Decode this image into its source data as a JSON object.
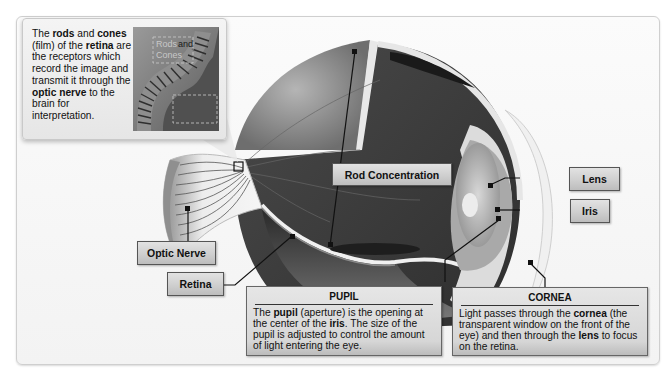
{
  "diagram": {
    "inset": {
      "text_parts": [
        {
          "t": "The ",
          "b": false
        },
        {
          "t": "rods",
          "b": true
        },
        {
          "t": " and ",
          "b": false
        },
        {
          "t": "cones",
          "b": true
        },
        {
          "t": " (film) of the ",
          "b": false
        },
        {
          "t": "retina",
          "b": true
        },
        {
          "t": " are the receptors which record the image and transmit it through the ",
          "b": false
        },
        {
          "t": "optic nerve",
          "b": true
        },
        {
          "t": " to the brain for interpretation.",
          "b": false
        }
      ],
      "image_label_line1_a": "Rods",
      "image_label_line1_b": "and",
      "image_label_line2": "Cones"
    },
    "labels": {
      "optic_nerve": "Optic Nerve",
      "retina": "Retina",
      "rod_concentration": "Rod Concentration",
      "lens": "Lens",
      "iris": "Iris"
    },
    "pupil_box": {
      "heading": "PUPIL",
      "text_parts": [
        {
          "t": "The ",
          "b": false
        },
        {
          "t": "pupil",
          "b": true
        },
        {
          "t": " (aperture) is the opening at the center of the ",
          "b": false
        },
        {
          "t": "iris",
          "b": true
        },
        {
          "t": ". The size of the pupil is adjusted to control the amount of light entering the eye.",
          "b": false
        }
      ]
    },
    "cornea_box": {
      "heading": "CORNEA",
      "text_parts": [
        {
          "t": "Light passes through the ",
          "b": false
        },
        {
          "t": "cornea",
          "b": true
        },
        {
          "t": " (the transparent window on the front of the eye) and then through the ",
          "b": false
        },
        {
          "t": "lens",
          "b": true
        },
        {
          "t": " to focus on the retina.",
          "b": false
        }
      ]
    },
    "colors": {
      "background": "#f6f6f6",
      "eye_interior": "#3c3c3c",
      "sclera": "#8a8a8a",
      "label_fill": "#d0d0d0",
      "leader_line": "#111111"
    }
  }
}
